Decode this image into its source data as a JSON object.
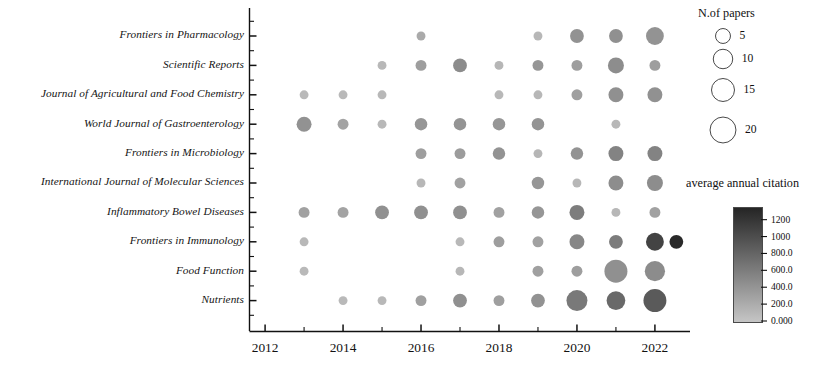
{
  "chart_data": {
    "type": "scatter",
    "subtype": "bubble",
    "title": "",
    "xlabel": "",
    "ylabel": "",
    "x": [
      2012,
      2013,
      2014,
      2015,
      2016,
      2017,
      2018,
      2019,
      2020,
      2021,
      2022
    ],
    "xlim": [
      2011.6,
      2022.9
    ],
    "xticks": [
      2012,
      2014,
      2016,
      2018,
      2020,
      2022
    ],
    "xtick_labels": [
      "2012",
      "2014",
      "2016",
      "2018",
      "2020",
      "2022"
    ],
    "xminor_ticks": [
      2013,
      2015,
      2017,
      2019,
      2021
    ],
    "categories": [
      "Frontiers in Pharmacology",
      "Scientific Reports",
      "Journal of Agricultural and Food Chemistry",
      "World Journal of Gastroenterology",
      "Frontiers in Microbiology",
      "International Journal of Molecular Sciences",
      "Inflammatory Bowel Diseases",
      "Frontiers in Immunology",
      "Food Function",
      "Nutrients"
    ],
    "size_legend": {
      "title": "N.of papers",
      "values": [
        5,
        10,
        15,
        20
      ],
      "labels": [
        "5",
        "10",
        "15",
        "20"
      ]
    },
    "color_legend": {
      "title": "average annual citation",
      "ticks": [
        1200,
        1000,
        800.0,
        600.0,
        400.0,
        200.0,
        0.0
      ],
      "tick_labels": [
        "1200",
        "1000",
        "800.0",
        "600.0",
        "400.0",
        "200.0",
        "0.000"
      ],
      "vmin": 0,
      "vmax": 1350,
      "low_color": "#b9b9b9",
      "high_color": "#2b2b2b",
      "orientation": "vertical",
      "high_at": "top"
    },
    "grid": false,
    "legend_position": "right",
    "points": [
      {
        "journal": "Frontiers in Pharmacology",
        "year": 2016,
        "papers": 1,
        "citation": 230
      },
      {
        "journal": "Frontiers in Pharmacology",
        "year": 2019,
        "papers": 1,
        "citation": 120
      },
      {
        "journal": "Frontiers in Pharmacology",
        "year": 2020,
        "papers": 4,
        "citation": 430
      },
      {
        "journal": "Frontiers in Pharmacology",
        "year": 2021,
        "papers": 4,
        "citation": 450
      },
      {
        "journal": "Frontiers in Pharmacology",
        "year": 2022,
        "papers": 8,
        "citation": 420
      },
      {
        "journal": "Scientific Reports",
        "year": 2015,
        "papers": 1,
        "citation": 110
      },
      {
        "journal": "Scientific Reports",
        "year": 2016,
        "papers": 2,
        "citation": 330
      },
      {
        "journal": "Scientific Reports",
        "year": 2017,
        "papers": 4,
        "citation": 480
      },
      {
        "journal": "Scientific Reports",
        "year": 2018,
        "papers": 1,
        "citation": 130
      },
      {
        "journal": "Scientific Reports",
        "year": 2019,
        "papers": 2,
        "citation": 400
      },
      {
        "journal": "Scientific Reports",
        "year": 2020,
        "papers": 2,
        "citation": 330
      },
      {
        "journal": "Scientific Reports",
        "year": 2021,
        "papers": 6,
        "citation": 470
      },
      {
        "journal": "Scientific Reports",
        "year": 2022,
        "papers": 2,
        "citation": 330
      },
      {
        "journal": "Journal of Agricultural and Food Chemistry",
        "year": 2013,
        "papers": 1,
        "citation": 100
      },
      {
        "journal": "Journal of Agricultural and Food Chemistry",
        "year": 2014,
        "papers": 1,
        "citation": 100
      },
      {
        "journal": "Journal of Agricultural and Food Chemistry",
        "year": 2015,
        "papers": 1,
        "citation": 110
      },
      {
        "journal": "Journal of Agricultural and Food Chemistry",
        "year": 2018,
        "papers": 1,
        "citation": 110
      },
      {
        "journal": "Journal of Agricultural and Food Chemistry",
        "year": 2019,
        "papers": 1,
        "citation": 120
      },
      {
        "journal": "Journal of Agricultural and Food Chemistry",
        "year": 2020,
        "papers": 2,
        "citation": 320
      },
      {
        "journal": "Journal of Agricultural and Food Chemistry",
        "year": 2021,
        "papers": 5,
        "citation": 450
      },
      {
        "journal": "Journal of Agricultural and Food Chemistry",
        "year": 2022,
        "papers": 5,
        "citation": 440
      },
      {
        "journal": "World Journal of Gastroenterology",
        "year": 2013,
        "papers": 5,
        "citation": 430
      },
      {
        "journal": "World Journal of Gastroenterology",
        "year": 2014,
        "papers": 2,
        "citation": 290
      },
      {
        "journal": "World Journal of Gastroenterology",
        "year": 2015,
        "papers": 1,
        "citation": 110
      },
      {
        "journal": "World Journal of Gastroenterology",
        "year": 2016,
        "papers": 3,
        "citation": 400
      },
      {
        "journal": "World Journal of Gastroenterology",
        "year": 2017,
        "papers": 3,
        "citation": 410
      },
      {
        "journal": "World Journal of Gastroenterology",
        "year": 2018,
        "papers": 3,
        "citation": 400
      },
      {
        "journal": "World Journal of Gastroenterology",
        "year": 2019,
        "papers": 3,
        "citation": 410
      },
      {
        "journal": "World Journal of Gastroenterology",
        "year": 2021,
        "papers": 1,
        "citation": 110
      },
      {
        "journal": "Frontiers in Microbiology",
        "year": 2016,
        "papers": 2,
        "citation": 330
      },
      {
        "journal": "Frontiers in Microbiology",
        "year": 2017,
        "papers": 2,
        "citation": 350
      },
      {
        "journal": "Frontiers in Microbiology",
        "year": 2018,
        "papers": 3,
        "citation": 420
      },
      {
        "journal": "Frontiers in Microbiology",
        "year": 2019,
        "papers": 1,
        "citation": 130
      },
      {
        "journal": "Frontiers in Microbiology",
        "year": 2020,
        "papers": 3,
        "citation": 420
      },
      {
        "journal": "Frontiers in Microbiology",
        "year": 2021,
        "papers": 5,
        "citation": 560
      },
      {
        "journal": "Frontiers in Microbiology",
        "year": 2022,
        "papers": 5,
        "citation": 560
      },
      {
        "journal": "International Journal of Molecular Sciences",
        "year": 2016,
        "papers": 1,
        "citation": 120
      },
      {
        "journal": "International Journal of Molecular Sciences",
        "year": 2017,
        "papers": 2,
        "citation": 300
      },
      {
        "journal": "International Journal of Molecular Sciences",
        "year": 2019,
        "papers": 3,
        "citation": 400
      },
      {
        "journal": "International Journal of Molecular Sciences",
        "year": 2020,
        "papers": 1,
        "citation": 120
      },
      {
        "journal": "International Journal of Molecular Sciences",
        "year": 2021,
        "papers": 5,
        "citation": 470
      },
      {
        "journal": "International Journal of Molecular Sciences",
        "year": 2022,
        "papers": 6,
        "citation": 470
      },
      {
        "journal": "Inflammatory Bowel Diseases",
        "year": 2013,
        "papers": 2,
        "citation": 300
      },
      {
        "journal": "Inflammatory Bowel Diseases",
        "year": 2014,
        "papers": 2,
        "citation": 290
      },
      {
        "journal": "Inflammatory Bowel Diseases",
        "year": 2015,
        "papers": 4,
        "citation": 450
      },
      {
        "journal": "Inflammatory Bowel Diseases",
        "year": 2016,
        "papers": 4,
        "citation": 450
      },
      {
        "journal": "Inflammatory Bowel Diseases",
        "year": 2017,
        "papers": 4,
        "citation": 450
      },
      {
        "journal": "Inflammatory Bowel Diseases",
        "year": 2018,
        "papers": 2,
        "citation": 300
      },
      {
        "journal": "Inflammatory Bowel Diseases",
        "year": 2019,
        "papers": 3,
        "citation": 400
      },
      {
        "journal": "Inflammatory Bowel Diseases",
        "year": 2020,
        "papers": 5,
        "citation": 610
      },
      {
        "journal": "Inflammatory Bowel Diseases",
        "year": 2021,
        "papers": 1,
        "citation": 120
      },
      {
        "journal": "Inflammatory Bowel Diseases",
        "year": 2022,
        "papers": 2,
        "citation": 300
      },
      {
        "journal": "Frontiers in Immunology",
        "year": 2013,
        "papers": 1,
        "citation": 110
      },
      {
        "journal": "Frontiers in Immunology",
        "year": 2017,
        "papers": 1,
        "citation": 110
      },
      {
        "journal": "Frontiers in Immunology",
        "year": 2018,
        "papers": 2,
        "citation": 330
      },
      {
        "journal": "Frontiers in Immunology",
        "year": 2019,
        "papers": 2,
        "citation": 300
      },
      {
        "journal": "Frontiers in Immunology",
        "year": 2020,
        "papers": 5,
        "citation": 520
      },
      {
        "journal": "Frontiers in Immunology",
        "year": 2021,
        "papers": 4,
        "citation": 620
      },
      {
        "journal": "Frontiers in Immunology",
        "year": 2022,
        "papers": 8,
        "citation": 1100
      },
      {
        "journal": "Frontiers in Immunology",
        "year": 2022.55,
        "papers": 4,
        "citation": 1320
      },
      {
        "journal": "Food Function",
        "year": 2013,
        "papers": 1,
        "citation": 100
      },
      {
        "journal": "Food Function",
        "year": 2017,
        "papers": 1,
        "citation": 120
      },
      {
        "journal": "Food Function",
        "year": 2019,
        "papers": 2,
        "citation": 310
      },
      {
        "journal": "Food Function",
        "year": 2020,
        "papers": 2,
        "citation": 330
      },
      {
        "journal": "Food Function",
        "year": 2021,
        "papers": 15,
        "citation": 450
      },
      {
        "journal": "Food Function",
        "year": 2022,
        "papers": 11,
        "citation": 480
      },
      {
        "journal": "Nutrients",
        "year": 2014,
        "papers": 1,
        "citation": 100
      },
      {
        "journal": "Nutrients",
        "year": 2015,
        "papers": 1,
        "citation": 110
      },
      {
        "journal": "Nutrients",
        "year": 2016,
        "papers": 2,
        "citation": 310
      },
      {
        "journal": "Nutrients",
        "year": 2017,
        "papers": 4,
        "citation": 450
      },
      {
        "journal": "Nutrients",
        "year": 2018,
        "papers": 2,
        "citation": 320
      },
      {
        "journal": "Nutrients",
        "year": 2019,
        "papers": 4,
        "citation": 430
      },
      {
        "journal": "Nutrients",
        "year": 2020,
        "papers": 12,
        "citation": 640
      },
      {
        "journal": "Nutrients",
        "year": 2021,
        "papers": 9,
        "citation": 780
      },
      {
        "journal": "Nutrients",
        "year": 2022,
        "papers": 15,
        "citation": 900
      }
    ]
  },
  "axes": {
    "x_tick_labels": [
      "2012",
      "2014",
      "2016",
      "2018",
      "2020",
      "2022"
    ],
    "y_tick_labels": [
      "Frontiers in Pharmacology",
      "Scientific Reports",
      "Journal of Agricultural and Food Chemistry",
      "World Journal of Gastroenterology",
      "Frontiers in Microbiology",
      "International Journal of Molecular Sciences",
      "Inflammatory Bowel Diseases",
      "Frontiers in Immunology",
      "Food Function",
      "Nutrients"
    ]
  },
  "size_legend": {
    "title": "N.of papers",
    "labels": [
      "5",
      "10",
      "15",
      "20"
    ]
  },
  "color_legend": {
    "title": "average annual citation",
    "tick_labels": [
      "1200",
      "1000",
      "800.0",
      "600.0",
      "400.0",
      "200.0",
      "0.000"
    ]
  }
}
